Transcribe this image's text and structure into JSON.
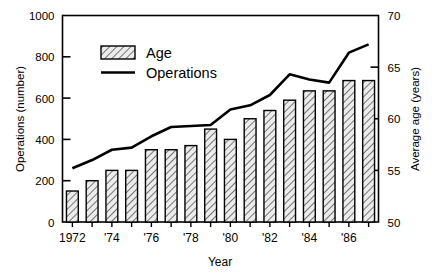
{
  "chart_data": {
    "type": "bar",
    "title": "",
    "xlabel": "Year",
    "ylabel": "Operations (number)",
    "y2label": "Average age (years)",
    "ylim": [
      0,
      1000
    ],
    "y2lim": [
      50,
      70
    ],
    "yticks": [
      "0",
      "200",
      "400",
      "600",
      "800",
      "1000"
    ],
    "ytick_values": [
      0,
      200,
      400,
      600,
      800,
      1000
    ],
    "y2ticks": [
      "50",
      "55",
      "60",
      "65",
      "70"
    ],
    "y2tick_values": [
      50,
      55,
      60,
      65,
      70
    ],
    "grid": false,
    "legend_position": "upper-left-inside",
    "categories": [
      1972,
      1973,
      1974,
      1975,
      1976,
      1977,
      1978,
      1979,
      1980,
      1981,
      1982,
      1983,
      1984,
      1985,
      1986,
      1987
    ],
    "xtick_labels": [
      "1972",
      "",
      "'74",
      "",
      "'76",
      "",
      "'78",
      "",
      "'80",
      "",
      "'82",
      "",
      "'84",
      "",
      "'86",
      ""
    ],
    "series": [
      {
        "name": "Age",
        "kind": "bar",
        "axis": "left",
        "values": [
          150,
          200,
          250,
          250,
          350,
          350,
          370,
          450,
          400,
          500,
          540,
          590,
          635,
          635,
          685,
          685
        ]
      },
      {
        "name": "Operations",
        "kind": "line",
        "axis": "right",
        "values": [
          55.2,
          56.0,
          57.0,
          57.2,
          58.3,
          59.2,
          59.3,
          59.4,
          60.9,
          61.3,
          62.3,
          64.3,
          63.8,
          63.5,
          66.4,
          67.2
        ]
      }
    ]
  },
  "legend": {
    "items": [
      {
        "label": "Age",
        "marker": "hatched-swatch"
      },
      {
        "label": "Operations",
        "marker": "line-segment"
      }
    ]
  },
  "colors": {
    "ink": "#000000",
    "background": "#ffffff",
    "bar_fill": "#e8e8e8",
    "hatch": "#555555"
  }
}
